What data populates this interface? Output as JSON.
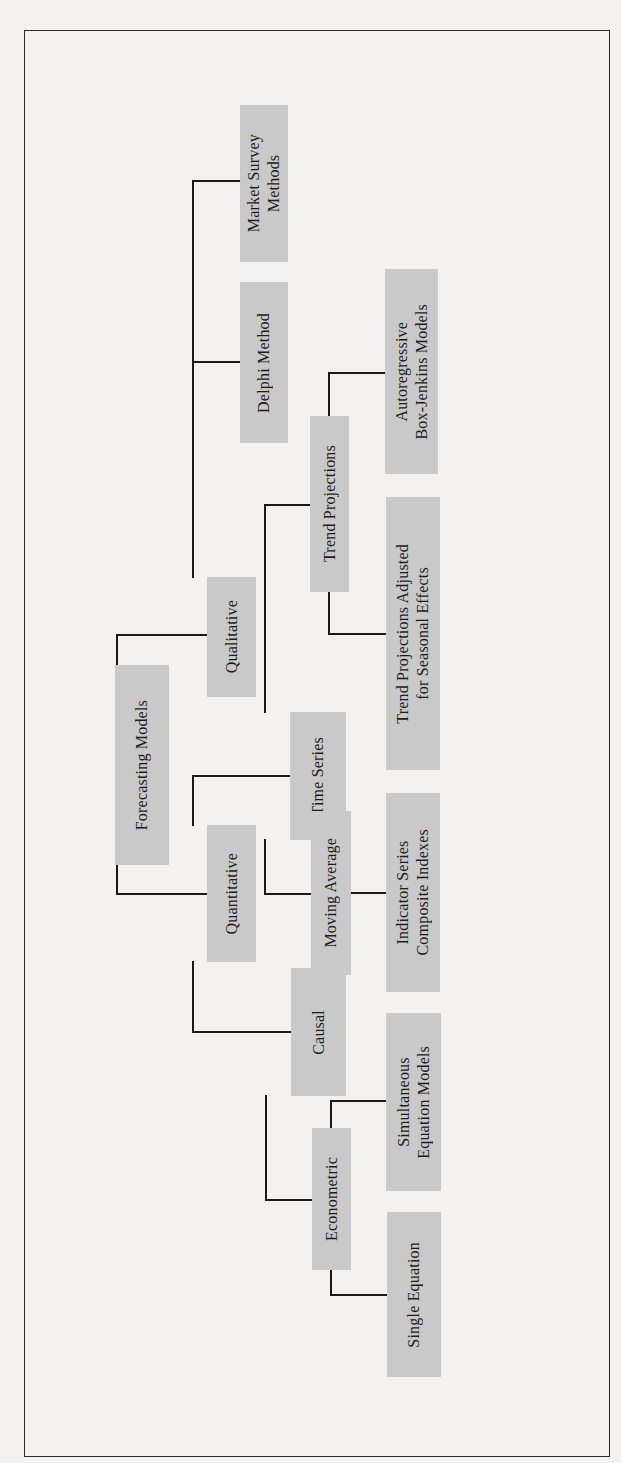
{
  "diagram": {
    "title": "Forecasting Models",
    "orientation": "rotated-90-ccw",
    "box_color": "#c9c9c9",
    "line_color": "#1a1a1a",
    "nodes": {
      "root": "Forecasting Models",
      "qualitative": "Qualitative",
      "quantitative": "Quantitative",
      "market_survey": "Market Survey\nMethods",
      "delphi": "Delphi Method",
      "time_series": "Time Series",
      "causal": "Causal",
      "trend_projections": "Trend Projections",
      "moving_average": "Moving Average",
      "autoregressive": "Autoregressive\nBox-Jenkins Models",
      "trend_adjusted": "Trend Projections Adjusted\nfor Seasonal Effects",
      "indicator_series": "Indicator Series\nComposite Indexes",
      "econometric": "Econometric",
      "simultaneous": "Simultaneous\nEquation Models",
      "single_equation": "Single Equation"
    },
    "edges": [
      [
        "Forecasting Models",
        "Qualitative"
      ],
      [
        "Forecasting Models",
        "Quantitative"
      ],
      [
        "Qualitative",
        "Delphi Method"
      ],
      [
        "Qualitative",
        "Market Survey Methods"
      ],
      [
        "Quantitative",
        "Time Series"
      ],
      [
        "Quantitative",
        "Causal"
      ],
      [
        "Time Series",
        "Trend Projections"
      ],
      [
        "Time Series",
        "Moving Average"
      ],
      [
        "Trend Projections",
        "Autoregressive Box-Jenkins Models"
      ],
      [
        "Trend Projections",
        "Trend Projections Adjusted for Seasonal Effects"
      ],
      [
        "Moving Average",
        "Indicator Series Composite Indexes"
      ],
      [
        "Causal",
        "Econometric"
      ],
      [
        "Econometric",
        "Simultaneous Equation Models"
      ],
      [
        "Econometric",
        "Single Equation"
      ]
    ]
  }
}
